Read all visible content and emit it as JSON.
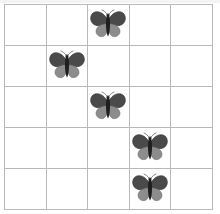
{
  "scene": {
    "title": "Butterfly counting grid",
    "background_color": "#ffffff",
    "width": 220,
    "height": 214
  },
  "grid": {
    "rows": 5,
    "columns": 5,
    "line_color": "#b9b9b9",
    "cell_background": "#ffffff",
    "label": "5 by 5 grid"
  },
  "butterfly": {
    "name": "butterfly",
    "upper_wing_color": "#4a4a4a",
    "upper_wing_edge_color": "#2e2e2e",
    "lower_wing_color": "#8c8c8c",
    "lower_wing_edge_color": "#6e6e6e",
    "body_color": "#1f1f1f",
    "antenna_color": "#555555",
    "count": 5
  },
  "cells": [
    {
      "row": 1,
      "col": 1,
      "occupied": false
    },
    {
      "row": 1,
      "col": 2,
      "occupied": false
    },
    {
      "row": 1,
      "col": 3,
      "occupied": true
    },
    {
      "row": 1,
      "col": 4,
      "occupied": false
    },
    {
      "row": 1,
      "col": 5,
      "occupied": false
    },
    {
      "row": 2,
      "col": 1,
      "occupied": false
    },
    {
      "row": 2,
      "col": 2,
      "occupied": true
    },
    {
      "row": 2,
      "col": 3,
      "occupied": false
    },
    {
      "row": 2,
      "col": 4,
      "occupied": false
    },
    {
      "row": 2,
      "col": 5,
      "occupied": false
    },
    {
      "row": 3,
      "col": 1,
      "occupied": false
    },
    {
      "row": 3,
      "col": 2,
      "occupied": false
    },
    {
      "row": 3,
      "col": 3,
      "occupied": true
    },
    {
      "row": 3,
      "col": 4,
      "occupied": false
    },
    {
      "row": 3,
      "col": 5,
      "occupied": false
    },
    {
      "row": 4,
      "col": 1,
      "occupied": false
    },
    {
      "row": 4,
      "col": 2,
      "occupied": false
    },
    {
      "row": 4,
      "col": 3,
      "occupied": false
    },
    {
      "row": 4,
      "col": 4,
      "occupied": true
    },
    {
      "row": 4,
      "col": 5,
      "occupied": false
    },
    {
      "row": 5,
      "col": 1,
      "occupied": false
    },
    {
      "row": 5,
      "col": 2,
      "occupied": false
    },
    {
      "row": 5,
      "col": 3,
      "occupied": false
    },
    {
      "row": 5,
      "col": 4,
      "occupied": true
    },
    {
      "row": 5,
      "col": 5,
      "occupied": false
    }
  ]
}
